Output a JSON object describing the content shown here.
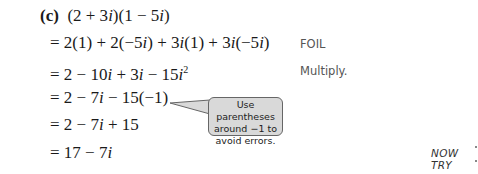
{
  "problem": {
    "label": "(c)",
    "expression_parts": [
      "(2 + 3",
      "i",
      ")(1 − 5",
      "i",
      ")"
    ]
  },
  "steps": [
    {
      "parts": [
        "= 2(1) + 2(−5",
        "i",
        ") + 3",
        "i",
        "(1) + 3",
        "i",
        "(−5",
        "i",
        ")"
      ],
      "annotation": "FOIL"
    },
    {
      "parts": [
        "= 2 − 10",
        "i",
        " + 3",
        "i",
        " − 15",
        "i"
      ],
      "superscript": "2",
      "annotation": "Multiply."
    },
    {
      "parts": [
        "= 2 − 7",
        "i",
        " − 15(−1)"
      ],
      "annotation": ""
    },
    {
      "parts": [
        "= 2 − 7",
        "i",
        " + 15"
      ],
      "annotation": ""
    },
    {
      "parts": [
        "= 17 − 7",
        "i"
      ],
      "annotation": ""
    }
  ],
  "callout": {
    "lines": [
      "Use parentheses",
      "around −1 to",
      "avoid errors."
    ]
  },
  "now_try": {
    "label": "NOW TRY"
  },
  "colors": {
    "callout_fill": "#d9d9d9",
    "callout_border": "#666666",
    "annotation_text": "#555555"
  }
}
